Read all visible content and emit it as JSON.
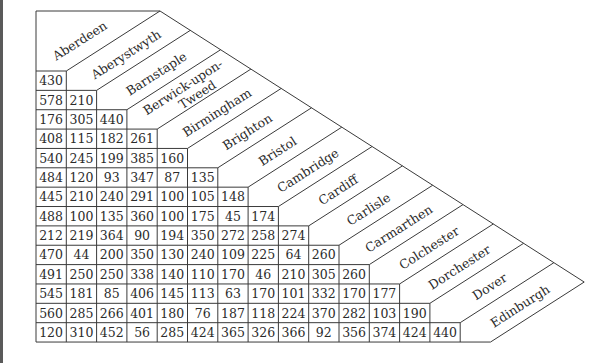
{
  "table": {
    "title": "Mileage chart",
    "towns": [
      "Aberdeen",
      "Aberystwyth",
      "Barnstaple",
      "Berwick-upon-|Tweed",
      "Birmingham",
      "Brighton",
      "Bristol",
      "Cambridge",
      "Cardiff",
      "Carlisle",
      "Carmarthen",
      "Colchester",
      "Dorchester",
      "Dover",
      "Edinburgh"
    ],
    "rows": [
      [
        430
      ],
      [
        578,
        210
      ],
      [
        176,
        305,
        440
      ],
      [
        408,
        115,
        182,
        261
      ],
      [
        540,
        245,
        199,
        385,
        160
      ],
      [
        484,
        120,
        93,
        347,
        87,
        135
      ],
      [
        445,
        210,
        240,
        291,
        100,
        105,
        148
      ],
      [
        488,
        100,
        135,
        360,
        100,
        175,
        45,
        174
      ],
      [
        212,
        219,
        364,
        90,
        194,
        350,
        272,
        258,
        274
      ],
      [
        470,
        44,
        200,
        350,
        130,
        240,
        109,
        225,
        64,
        260
      ],
      [
        491,
        250,
        250,
        338,
        140,
        110,
        170,
        46,
        210,
        305,
        260
      ],
      [
        545,
        181,
        85,
        406,
        145,
        113,
        63,
        170,
        101,
        332,
        170,
        177
      ],
      [
        560,
        285,
        266,
        401,
        180,
        76,
        187,
        118,
        224,
        370,
        282,
        103,
        190
      ],
      [
        120,
        310,
        452,
        56,
        285,
        424,
        365,
        326,
        366,
        92,
        356,
        374,
        424,
        440
      ]
    ]
  },
  "colors": {
    "line": "#3a3a3a",
    "text": "#2b2b2b",
    "background": "#ffffff"
  }
}
